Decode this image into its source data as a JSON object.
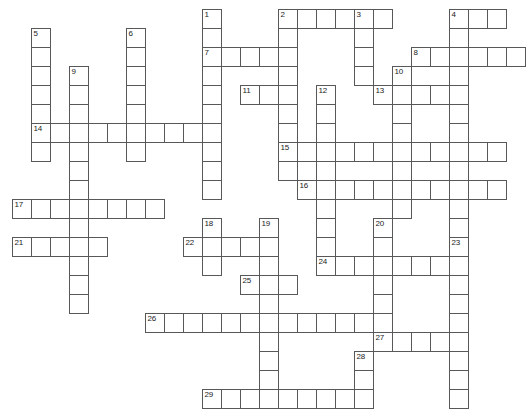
{
  "puzzle": {
    "type": "crossword-grid",
    "title": "Crossword puzzle grid",
    "cell_size": 19,
    "origin_x": 12,
    "origin_y": 9,
    "grid_line_color": "#58585a",
    "cell_fill_color": "#ffffff",
    "background_color": "#ffffff",
    "number_color": "#1b1b1b",
    "entry_count": 29,
    "entries": [
      {
        "number": "1",
        "direction": "down",
        "col": 10,
        "row": 0,
        "length": 10
      },
      {
        "number": "2",
        "direction": "across",
        "col": 14,
        "row": 0,
        "length": 6
      },
      {
        "number": "2",
        "direction": "down",
        "col": 14,
        "row": 0,
        "length": 9
      },
      {
        "number": "3",
        "direction": "down",
        "col": 18,
        "row": 0,
        "length": 4
      },
      {
        "number": "4",
        "direction": "across",
        "col": 23,
        "row": 0,
        "length": 3
      },
      {
        "number": "4",
        "direction": "down",
        "col": 23,
        "row": 0,
        "length": 8
      },
      {
        "number": "5",
        "direction": "down",
        "col": 1,
        "row": 1,
        "length": 7
      },
      {
        "number": "6",
        "direction": "down",
        "col": 6,
        "row": 1,
        "length": 7
      },
      {
        "number": "7",
        "direction": "across",
        "col": 10,
        "row": 2,
        "length": 5
      },
      {
        "number": "8",
        "direction": "across",
        "col": 21,
        "row": 2,
        "length": 6
      },
      {
        "number": "9",
        "direction": "down",
        "col": 3,
        "row": 3,
        "length": 9
      },
      {
        "number": "10",
        "direction": "down",
        "col": 20,
        "row": 3,
        "length": 6
      },
      {
        "number": "11",
        "direction": "across",
        "col": 12,
        "row": 4,
        "length": 2
      },
      {
        "number": "12",
        "direction": "down",
        "col": 16,
        "row": 4,
        "length": 9
      },
      {
        "number": "13",
        "direction": "across",
        "col": 19,
        "row": 4,
        "length": 5
      },
      {
        "number": "14",
        "direction": "across",
        "col": 1,
        "row": 6,
        "length": 10
      },
      {
        "number": "15",
        "direction": "across",
        "col": 14,
        "row": 7,
        "length": 12
      },
      {
        "number": "16",
        "direction": "across",
        "col": 15,
        "row": 9,
        "length": 11
      },
      {
        "number": "17",
        "direction": "across",
        "col": 0,
        "row": 10,
        "length": 8
      },
      {
        "number": "18",
        "direction": "down",
        "col": 10,
        "row": 11,
        "length": 3
      },
      {
        "number": "19",
        "direction": "down",
        "col": 13,
        "row": 11,
        "length": 9
      },
      {
        "number": "20",
        "direction": "down",
        "col": 19,
        "row": 11,
        "length": 6
      },
      {
        "number": "21",
        "direction": "across",
        "col": 0,
        "row": 12,
        "length": 5
      },
      {
        "number": "22",
        "direction": "across",
        "col": 9,
        "row": 12,
        "length": 5
      },
      {
        "number": "23",
        "direction": "down",
        "col": 23,
        "row": 12,
        "length": 9
      },
      {
        "number": "24",
        "direction": "across",
        "col": 16,
        "row": 13,
        "length": 8
      },
      {
        "number": "25",
        "direction": "across",
        "col": 12,
        "row": 14,
        "length": 3
      },
      {
        "number": "26",
        "direction": "across",
        "col": 7,
        "row": 16,
        "length": 13
      },
      {
        "number": "27",
        "direction": "across",
        "col": 19,
        "row": 17,
        "length": 5
      },
      {
        "number": "28",
        "direction": "down",
        "col": 18,
        "row": 18,
        "length": 3
      },
      {
        "number": "29",
        "direction": "across",
        "col": 10,
        "row": 20,
        "length": 9
      }
    ],
    "cells": [
      {
        "col": 10,
        "row": 0,
        "number": "1"
      },
      {
        "col": 14,
        "row": 0,
        "number": "2"
      },
      {
        "col": 15,
        "row": 0,
        "number": null
      },
      {
        "col": 16,
        "row": 0,
        "number": null
      },
      {
        "col": 17,
        "row": 0,
        "number": null
      },
      {
        "col": 18,
        "row": 0,
        "number": "3"
      },
      {
        "col": 19,
        "row": 0,
        "number": null
      },
      {
        "col": 23,
        "row": 0,
        "number": "4"
      },
      {
        "col": 24,
        "row": 0,
        "number": null
      },
      {
        "col": 25,
        "row": 0,
        "number": null
      },
      {
        "col": 1,
        "row": 1,
        "number": "5"
      },
      {
        "col": 6,
        "row": 1,
        "number": "6"
      },
      {
        "col": 10,
        "row": 1,
        "number": null
      },
      {
        "col": 14,
        "row": 1,
        "number": null
      },
      {
        "col": 18,
        "row": 1,
        "number": null
      },
      {
        "col": 23,
        "row": 1,
        "number": null
      },
      {
        "col": 1,
        "row": 2,
        "number": null
      },
      {
        "col": 6,
        "row": 2,
        "number": null
      },
      {
        "col": 10,
        "row": 2,
        "number": "7"
      },
      {
        "col": 11,
        "row": 2,
        "number": null
      },
      {
        "col": 12,
        "row": 2,
        "number": null
      },
      {
        "col": 13,
        "row": 2,
        "number": null
      },
      {
        "col": 14,
        "row": 2,
        "number": null
      },
      {
        "col": 18,
        "row": 2,
        "number": null
      },
      {
        "col": 21,
        "row": 2,
        "number": "8"
      },
      {
        "col": 22,
        "row": 2,
        "number": null
      },
      {
        "col": 23,
        "row": 2,
        "number": null
      },
      {
        "col": 24,
        "row": 2,
        "number": null
      },
      {
        "col": 25,
        "row": 2,
        "number": null
      },
      {
        "col": 26,
        "row": 2,
        "number": null
      },
      {
        "col": 1,
        "row": 3,
        "number": null
      },
      {
        "col": 3,
        "row": 3,
        "number": "9"
      },
      {
        "col": 6,
        "row": 3,
        "number": null
      },
      {
        "col": 10,
        "row": 3,
        "number": null
      },
      {
        "col": 14,
        "row": 3,
        "number": null
      },
      {
        "col": 18,
        "row": 3,
        "number": null
      },
      {
        "col": 20,
        "row": 3,
        "number": "10"
      },
      {
        "col": 23,
        "row": 3,
        "number": null
      },
      {
        "col": 1,
        "row": 4,
        "number": null
      },
      {
        "col": 3,
        "row": 4,
        "number": null
      },
      {
        "col": 6,
        "row": 4,
        "number": null
      },
      {
        "col": 10,
        "row": 4,
        "number": null
      },
      {
        "col": 12,
        "row": 4,
        "number": "11"
      },
      {
        "col": 13,
        "row": 4,
        "number": null
      },
      {
        "col": 14,
        "row": 4,
        "number": null
      },
      {
        "col": 16,
        "row": 4,
        "number": "12"
      },
      {
        "col": 19,
        "row": 4,
        "number": "13"
      },
      {
        "col": 20,
        "row": 4,
        "number": null
      },
      {
        "col": 21,
        "row": 4,
        "number": null
      },
      {
        "col": 22,
        "row": 4,
        "number": null
      },
      {
        "col": 23,
        "row": 4,
        "number": null
      },
      {
        "col": 1,
        "row": 5,
        "number": null
      },
      {
        "col": 3,
        "row": 5,
        "number": null
      },
      {
        "col": 6,
        "row": 5,
        "number": null
      },
      {
        "col": 10,
        "row": 5,
        "number": null
      },
      {
        "col": 14,
        "row": 5,
        "number": null
      },
      {
        "col": 16,
        "row": 5,
        "number": null
      },
      {
        "col": 20,
        "row": 5,
        "number": null
      },
      {
        "col": 23,
        "row": 5,
        "number": null
      },
      {
        "col": 1,
        "row": 6,
        "number": "14"
      },
      {
        "col": 2,
        "row": 6,
        "number": null
      },
      {
        "col": 3,
        "row": 6,
        "number": null
      },
      {
        "col": 4,
        "row": 6,
        "number": null
      },
      {
        "col": 5,
        "row": 6,
        "number": null
      },
      {
        "col": 6,
        "row": 6,
        "number": null
      },
      {
        "col": 7,
        "row": 6,
        "number": null
      },
      {
        "col": 8,
        "row": 6,
        "number": null
      },
      {
        "col": 9,
        "row": 6,
        "number": null
      },
      {
        "col": 10,
        "row": 6,
        "number": null
      },
      {
        "col": 14,
        "row": 6,
        "number": null
      },
      {
        "col": 16,
        "row": 6,
        "number": null
      },
      {
        "col": 20,
        "row": 6,
        "number": null
      },
      {
        "col": 23,
        "row": 6,
        "number": null
      },
      {
        "col": 1,
        "row": 7,
        "number": null
      },
      {
        "col": 3,
        "row": 7,
        "number": null
      },
      {
        "col": 6,
        "row": 7,
        "number": null
      },
      {
        "col": 10,
        "row": 7,
        "number": null
      },
      {
        "col": 14,
        "row": 7,
        "number": "15"
      },
      {
        "col": 15,
        "row": 7,
        "number": null
      },
      {
        "col": 16,
        "row": 7,
        "number": null
      },
      {
        "col": 17,
        "row": 7,
        "number": null
      },
      {
        "col": 18,
        "row": 7,
        "number": null
      },
      {
        "col": 19,
        "row": 7,
        "number": null
      },
      {
        "col": 20,
        "row": 7,
        "number": null
      },
      {
        "col": 21,
        "row": 7,
        "number": null
      },
      {
        "col": 22,
        "row": 7,
        "number": null
      },
      {
        "col": 23,
        "row": 7,
        "number": null
      },
      {
        "col": 24,
        "row": 7,
        "number": null
      },
      {
        "col": 25,
        "row": 7,
        "number": null
      },
      {
        "col": 3,
        "row": 8,
        "number": null
      },
      {
        "col": 10,
        "row": 8,
        "number": null
      },
      {
        "col": 14,
        "row": 8,
        "number": null
      },
      {
        "col": 16,
        "row": 8,
        "number": null
      },
      {
        "col": 20,
        "row": 8,
        "number": null
      },
      {
        "col": 23,
        "row": 8,
        "number": null
      },
      {
        "col": 3,
        "row": 9,
        "number": null
      },
      {
        "col": 10,
        "row": 9,
        "number": null
      },
      {
        "col": 15,
        "row": 9,
        "number": "16"
      },
      {
        "col": 16,
        "row": 9,
        "number": null
      },
      {
        "col": 17,
        "row": 9,
        "number": null
      },
      {
        "col": 18,
        "row": 9,
        "number": null
      },
      {
        "col": 19,
        "row": 9,
        "number": null
      },
      {
        "col": 20,
        "row": 9,
        "number": null
      },
      {
        "col": 21,
        "row": 9,
        "number": null
      },
      {
        "col": 22,
        "row": 9,
        "number": null
      },
      {
        "col": 23,
        "row": 9,
        "number": null
      },
      {
        "col": 24,
        "row": 9,
        "number": null
      },
      {
        "col": 25,
        "row": 9,
        "number": null
      },
      {
        "col": 0,
        "row": 10,
        "number": "17"
      },
      {
        "col": 1,
        "row": 10,
        "number": null
      },
      {
        "col": 2,
        "row": 10,
        "number": null
      },
      {
        "col": 3,
        "row": 10,
        "number": null
      },
      {
        "col": 4,
        "row": 10,
        "number": null
      },
      {
        "col": 5,
        "row": 10,
        "number": null
      },
      {
        "col": 6,
        "row": 10,
        "number": null
      },
      {
        "col": 7,
        "row": 10,
        "number": null
      },
      {
        "col": 16,
        "row": 10,
        "number": null
      },
      {
        "col": 20,
        "row": 10,
        "number": null
      },
      {
        "col": 23,
        "row": 10,
        "number": null
      },
      {
        "col": 3,
        "row": 11,
        "number": null
      },
      {
        "col": 10,
        "row": 11,
        "number": "18"
      },
      {
        "col": 13,
        "row": 11,
        "number": "19"
      },
      {
        "col": 16,
        "row": 11,
        "number": null
      },
      {
        "col": 19,
        "row": 11,
        "number": "20"
      },
      {
        "col": 23,
        "row": 11,
        "number": null
      },
      {
        "col": 0,
        "row": 12,
        "number": "21"
      },
      {
        "col": 1,
        "row": 12,
        "number": null
      },
      {
        "col": 2,
        "row": 12,
        "number": null
      },
      {
        "col": 3,
        "row": 12,
        "number": null
      },
      {
        "col": 4,
        "row": 12,
        "number": null
      },
      {
        "col": 9,
        "row": 12,
        "number": "22"
      },
      {
        "col": 10,
        "row": 12,
        "number": null
      },
      {
        "col": 11,
        "row": 12,
        "number": null
      },
      {
        "col": 12,
        "row": 12,
        "number": null
      },
      {
        "col": 13,
        "row": 12,
        "number": null
      },
      {
        "col": 16,
        "row": 12,
        "number": null
      },
      {
        "col": 19,
        "row": 12,
        "number": null
      },
      {
        "col": 23,
        "row": 12,
        "number": "23"
      },
      {
        "col": 3,
        "row": 13,
        "number": null
      },
      {
        "col": 10,
        "row": 13,
        "number": null
      },
      {
        "col": 13,
        "row": 13,
        "number": null
      },
      {
        "col": 16,
        "row": 13,
        "number": "24"
      },
      {
        "col": 17,
        "row": 13,
        "number": null
      },
      {
        "col": 18,
        "row": 13,
        "number": null
      },
      {
        "col": 19,
        "row": 13,
        "number": null
      },
      {
        "col": 20,
        "row": 13,
        "number": null
      },
      {
        "col": 21,
        "row": 13,
        "number": null
      },
      {
        "col": 22,
        "row": 13,
        "number": null
      },
      {
        "col": 23,
        "row": 13,
        "number": null
      },
      {
        "col": 3,
        "row": 14,
        "number": null
      },
      {
        "col": 12,
        "row": 14,
        "number": "25"
      },
      {
        "col": 13,
        "row": 14,
        "number": null
      },
      {
        "col": 14,
        "row": 14,
        "number": null
      },
      {
        "col": 19,
        "row": 14,
        "number": null
      },
      {
        "col": 23,
        "row": 14,
        "number": null
      },
      {
        "col": 3,
        "row": 15,
        "number": null
      },
      {
        "col": 13,
        "row": 15,
        "number": null
      },
      {
        "col": 19,
        "row": 15,
        "number": null
      },
      {
        "col": 23,
        "row": 15,
        "number": null
      },
      {
        "col": 7,
        "row": 16,
        "number": "26"
      },
      {
        "col": 8,
        "row": 16,
        "number": null
      },
      {
        "col": 9,
        "row": 16,
        "number": null
      },
      {
        "col": 10,
        "row": 16,
        "number": null
      },
      {
        "col": 11,
        "row": 16,
        "number": null
      },
      {
        "col": 12,
        "row": 16,
        "number": null
      },
      {
        "col": 13,
        "row": 16,
        "number": null
      },
      {
        "col": 14,
        "row": 16,
        "number": null
      },
      {
        "col": 15,
        "row": 16,
        "number": null
      },
      {
        "col": 16,
        "row": 16,
        "number": null
      },
      {
        "col": 17,
        "row": 16,
        "number": null
      },
      {
        "col": 18,
        "row": 16,
        "number": null
      },
      {
        "col": 19,
        "row": 16,
        "number": null
      },
      {
        "col": 23,
        "row": 16,
        "number": null
      },
      {
        "col": 13,
        "row": 17,
        "number": null
      },
      {
        "col": 19,
        "row": 17,
        "number": "27"
      },
      {
        "col": 20,
        "row": 17,
        "number": null
      },
      {
        "col": 21,
        "row": 17,
        "number": null
      },
      {
        "col": 22,
        "row": 17,
        "number": null
      },
      {
        "col": 23,
        "row": 17,
        "number": null
      },
      {
        "col": 13,
        "row": 18,
        "number": null
      },
      {
        "col": 18,
        "row": 18,
        "number": "28"
      },
      {
        "col": 23,
        "row": 18,
        "number": null
      },
      {
        "col": 13,
        "row": 19,
        "number": null
      },
      {
        "col": 18,
        "row": 19,
        "number": null
      },
      {
        "col": 23,
        "row": 19,
        "number": null
      },
      {
        "col": 10,
        "row": 20,
        "number": "29"
      },
      {
        "col": 11,
        "row": 20,
        "number": null
      },
      {
        "col": 12,
        "row": 20,
        "number": null
      },
      {
        "col": 13,
        "row": 20,
        "number": null
      },
      {
        "col": 14,
        "row": 20,
        "number": null
      },
      {
        "col": 15,
        "row": 20,
        "number": null
      },
      {
        "col": 16,
        "row": 20,
        "number": null
      },
      {
        "col": 17,
        "row": 20,
        "number": null
      },
      {
        "col": 18,
        "row": 20,
        "number": null
      },
      {
        "col": 23,
        "row": 20,
        "number": null
      }
    ]
  }
}
